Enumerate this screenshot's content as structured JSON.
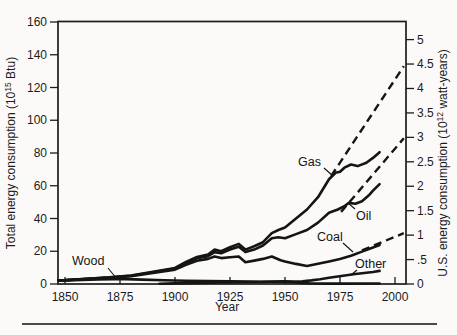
{
  "chart_data": {
    "type": "line",
    "title": "",
    "xlabel": "Year",
    "ylabel_left": "Total energy consumption (10^15 Btu)",
    "ylabel_right": "U.S. energy consumption (10^12 watt-years)",
    "ylabel_left_parts": {
      "prefix": "Total energy consumption (10",
      "sup": "15",
      "suffix": " Btu)"
    },
    "ylabel_right_parts": {
      "prefix": "U.S. energy consumption (10",
      "sup": "12",
      "suffix": " watt-years)"
    },
    "xlim": [
      1847,
      2005
    ],
    "ylim_left": [
      0,
      160
    ],
    "ylim_right": [
      0,
      5
    ],
    "right_axis_scale_quads_per_unit": 29.85,
    "grid": "off",
    "legend": "inline-curve-labels",
    "x_ticks": [
      {
        "v": 1850,
        "label": "1850"
      },
      {
        "v": 1875,
        "label": "1875"
      },
      {
        "v": 1900,
        "label": "1900"
      },
      {
        "v": 1925,
        "label": "1925"
      },
      {
        "v": 1950,
        "label": "1950"
      },
      {
        "v": 1975,
        "label": "1975"
      },
      {
        "v": 2000,
        "label": "2000"
      }
    ],
    "y_ticks_left": [
      {
        "v": 0,
        "label": "0"
      },
      {
        "v": 20,
        "label": "20"
      },
      {
        "v": 40,
        "label": "40"
      },
      {
        "v": 60,
        "label": "60"
      },
      {
        "v": 80,
        "label": "80"
      },
      {
        "v": 100,
        "label": "100"
      },
      {
        "v": 120,
        "label": "120"
      },
      {
        "v": 140,
        "label": "140"
      },
      {
        "v": 160,
        "label": "160"
      }
    ],
    "y_ticks_right": [
      {
        "v": 0,
        "label": "0"
      },
      {
        "v": 0.5,
        "label": ".5"
      },
      {
        "v": 1,
        "label": "1"
      },
      {
        "v": 1.5,
        "label": "1.5"
      },
      {
        "v": 2,
        "label": "2"
      },
      {
        "v": 2.5,
        "label": "2.5"
      },
      {
        "v": 3,
        "label": "3"
      },
      {
        "v": 3.5,
        "label": "3.5"
      },
      {
        "v": 4,
        "label": "4"
      },
      {
        "v": 4.5,
        "label": "4.5"
      },
      {
        "v": 5,
        "label": "5"
      }
    ],
    "series": [
      {
        "name": "Gas",
        "style": "solid",
        "points": [
          [
            1847,
            2.3
          ],
          [
            1850,
            2.4
          ],
          [
            1860,
            3.2
          ],
          [
            1870,
            4.0
          ],
          [
            1880,
            5.2
          ],
          [
            1890,
            7.5
          ],
          [
            1900,
            9.8
          ],
          [
            1905,
            13.5
          ],
          [
            1910,
            16.5
          ],
          [
            1915,
            18.0
          ],
          [
            1918,
            21.0
          ],
          [
            1921,
            20.0
          ],
          [
            1925,
            22.5
          ],
          [
            1929,
            24.5
          ],
          [
            1932,
            21.0
          ],
          [
            1936,
            23.0
          ],
          [
            1940,
            25.5
          ],
          [
            1944,
            31.0
          ],
          [
            1947,
            33.0
          ],
          [
            1950,
            34.5
          ],
          [
            1955,
            40.0
          ],
          [
            1960,
            45.5
          ],
          [
            1965,
            53.0
          ],
          [
            1970,
            64.0
          ],
          [
            1973,
            68.0
          ],
          [
            1975,
            68.5
          ],
          [
            1977,
            71.0
          ],
          [
            1980,
            73.0
          ],
          [
            1983,
            72.0
          ],
          [
            1987,
            74.0
          ],
          [
            1990,
            77.0
          ],
          [
            1993,
            80.5
          ]
        ]
      },
      {
        "name": "Oil",
        "style": "solid",
        "points": [
          [
            1847,
            2.25
          ],
          [
            1850,
            2.35
          ],
          [
            1860,
            3.1
          ],
          [
            1870,
            3.9
          ],
          [
            1880,
            5.0
          ],
          [
            1890,
            7.2
          ],
          [
            1900,
            9.4
          ],
          [
            1905,
            12.8
          ],
          [
            1910,
            15.7
          ],
          [
            1915,
            17.0
          ],
          [
            1918,
            19.5
          ],
          [
            1921,
            18.8
          ],
          [
            1925,
            21.0
          ],
          [
            1929,
            22.8
          ],
          [
            1932,
            19.5
          ],
          [
            1936,
            21.0
          ],
          [
            1940,
            23.5
          ],
          [
            1944,
            28.0
          ],
          [
            1947,
            28.5
          ],
          [
            1950,
            28.0
          ],
          [
            1955,
            30.5
          ],
          [
            1960,
            33.0
          ],
          [
            1965,
            37.5
          ],
          [
            1970,
            43.5
          ],
          [
            1974,
            45.5
          ],
          [
            1977,
            47.5
          ],
          [
            1979,
            49.5
          ],
          [
            1982,
            49.0
          ],
          [
            1985,
            50.5
          ],
          [
            1988,
            54.0
          ],
          [
            1990,
            57.0
          ],
          [
            1993,
            61.0
          ]
        ]
      },
      {
        "name": "Coal",
        "style": "solid",
        "points": [
          [
            1847,
            2.2
          ],
          [
            1850,
            2.3
          ],
          [
            1860,
            3.0
          ],
          [
            1870,
            3.7
          ],
          [
            1880,
            4.7
          ],
          [
            1890,
            6.8
          ],
          [
            1900,
            8.8
          ],
          [
            1905,
            11.8
          ],
          [
            1910,
            14.2
          ],
          [
            1915,
            15.3
          ],
          [
            1918,
            16.8
          ],
          [
            1921,
            15.8
          ],
          [
            1925,
            16.3
          ],
          [
            1929,
            16.8
          ],
          [
            1932,
            13.3
          ],
          [
            1936,
            14.3
          ],
          [
            1940,
            15.3
          ],
          [
            1944,
            16.8
          ],
          [
            1948,
            14.5
          ],
          [
            1950,
            13.8
          ],
          [
            1955,
            12.3
          ],
          [
            1960,
            11.0
          ],
          [
            1965,
            12.4
          ],
          [
            1970,
            13.8
          ],
          [
            1975,
            15.3
          ],
          [
            1980,
            17.3
          ],
          [
            1985,
            19.8
          ],
          [
            1990,
            22.3
          ],
          [
            1993,
            23.8
          ]
        ]
      },
      {
        "name": "Wood",
        "style": "solid",
        "points": [
          [
            1847,
            2.1
          ],
          [
            1850,
            2.2
          ],
          [
            1858,
            2.5
          ],
          [
            1865,
            2.8
          ],
          [
            1872,
            3.0
          ],
          [
            1878,
            3.0
          ],
          [
            1885,
            2.7
          ],
          [
            1895,
            2.3
          ],
          [
            1905,
            1.95
          ],
          [
            1915,
            1.75
          ],
          [
            1925,
            1.6
          ],
          [
            1935,
            1.5
          ],
          [
            1945,
            1.4
          ],
          [
            1950,
            1.3
          ],
          [
            1954,
            1.1
          ],
          [
            1958,
            0.6
          ],
          [
            1962,
            0.3
          ],
          [
            1970,
            0.25
          ],
          [
            1980,
            0.25
          ],
          [
            1990,
            0.3
          ],
          [
            1993,
            0.3
          ]
        ]
      },
      {
        "name": "Other",
        "style": "solid",
        "points": [
          [
            1893,
            0.15
          ],
          [
            1900,
            0.35
          ],
          [
            1910,
            0.65
          ],
          [
            1920,
            0.95
          ],
          [
            1930,
            1.1
          ],
          [
            1940,
            1.25
          ],
          [
            1945,
            1.5
          ],
          [
            1950,
            1.6
          ],
          [
            1954,
            1.5
          ],
          [
            1958,
            1.7
          ],
          [
            1962,
            2.2
          ],
          [
            1966,
            2.9
          ],
          [
            1970,
            3.8
          ],
          [
            1974,
            4.6
          ],
          [
            1978,
            5.4
          ],
          [
            1982,
            6.1
          ],
          [
            1986,
            6.7
          ],
          [
            1990,
            7.3
          ],
          [
            1993,
            8.0
          ]
        ]
      },
      {
        "name": "projection-high",
        "style": "dashed",
        "points": [
          [
            1971,
            66
          ],
          [
            2004,
            133
          ]
        ]
      },
      {
        "name": "projection-mid",
        "style": "dashed",
        "points": [
          [
            1975.5,
            44
          ],
          [
            2004,
            89
          ]
        ]
      },
      {
        "name": "coal-projection",
        "style": "dashed",
        "points": [
          [
            1985,
            20.5
          ],
          [
            2004,
            31
          ]
        ]
      }
    ],
    "annotations": [
      {
        "text": "Wood",
        "tx": 72,
        "ty": 265,
        "leader": [
          108,
          268,
          117,
          279
        ]
      },
      {
        "text": "Gas",
        "tx": 298,
        "ty": 166,
        "leader": [
          324,
          168,
          333,
          176
        ]
      },
      {
        "text": "Oil",
        "tx": 356,
        "ty": 220,
        "leader": [
          355,
          209,
          348,
          203
        ]
      },
      {
        "text": "Coal",
        "tx": 317,
        "ty": 241,
        "leader": [
          343,
          243,
          353,
          252
        ]
      },
      {
        "text": "Other",
        "tx": 355,
        "ty": 268,
        "leader": [
          357,
          270,
          351,
          275
        ]
      }
    ]
  }
}
